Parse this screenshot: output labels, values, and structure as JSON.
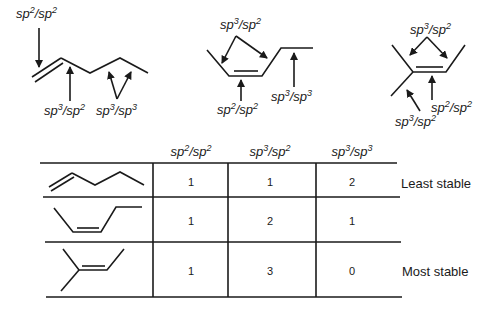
{
  "diagram": {
    "labels": {
      "sp2sp2": {
        "a": "sp",
        "a_sup": "2",
        "sep": "/sp",
        "b_sup": "2"
      },
      "sp3sp2": {
        "a": "sp",
        "a_sup": "3",
        "sep": "/sp",
        "b_sup": "2"
      },
      "sp3sp3": {
        "a": "sp",
        "a_sup": "3",
        "sep": "/sp",
        "b_sup": "3"
      }
    },
    "molecules": [
      {
        "name": "1-pentene",
        "annotations": [
          "sp2/sp2",
          "sp3/sp2",
          "sp3/sp3"
        ]
      },
      {
        "name": "cis-2-pentene",
        "annotations": [
          "sp3/sp2",
          "sp2/sp2",
          "sp3/sp3"
        ]
      },
      {
        "name": "2-methyl-2-butene",
        "annotations": [
          "sp3/sp2",
          "sp2/sp2",
          "sp3/sp2"
        ]
      }
    ]
  },
  "table": {
    "headers": [
      "sp2/sp2",
      "sp3/sp2",
      "sp3/sp3"
    ],
    "rows": [
      {
        "molecule": "1-pentene",
        "values": [
          "1",
          "1",
          "2"
        ],
        "note": "Least stable"
      },
      {
        "molecule": "cis-2-pentene",
        "values": [
          "1",
          "2",
          "1"
        ],
        "note": ""
      },
      {
        "molecule": "2-methyl-2-butene",
        "values": [
          "1",
          "3",
          "0"
        ],
        "note": "Most stable"
      }
    ]
  }
}
